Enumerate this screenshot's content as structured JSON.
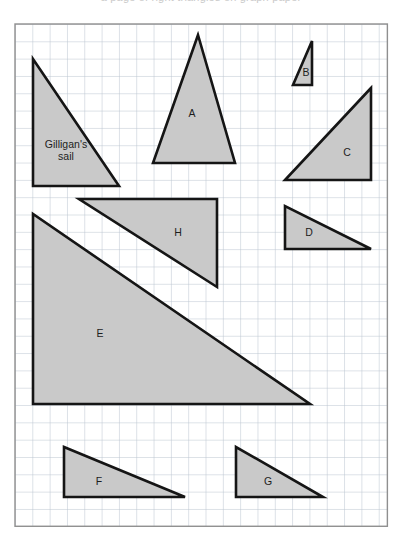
{
  "page": {
    "title_strip": "a page of right triangles on graph paper",
    "width": 402,
    "height": 549,
    "background_color": "#ffffff"
  },
  "grid": {
    "name": "graph-paper-grid",
    "origin_x": 15,
    "origin_y": 24,
    "cell_size": 17.32,
    "cols": 21.5,
    "rows": 29,
    "line_color": "#b9c4cf",
    "border_color": "#8f8f8f",
    "fill_color": "#ffffff"
  },
  "style": {
    "triangle_fill": "#c9c9c9",
    "triangle_stroke": "#151515",
    "triangle_stroke_width": 2.6,
    "label_color": "#1d1d1d"
  },
  "shapes": [
    {
      "id": "gilligans-sail",
      "label": "Gilligan's sail",
      "label_lines": [
        "Gilligan's",
        "sail"
      ],
      "label_x": 66,
      "label_y": 150,
      "points": "33,59 33,186 119,186"
    },
    {
      "id": "triangle-a",
      "label": "A",
      "label_lines": [
        "A"
      ],
      "label_x": 192,
      "label_y": 113,
      "points": "198,35 153,163 235,163"
    },
    {
      "id": "triangle-b",
      "label": "B",
      "label_lines": [
        "B"
      ],
      "label_x": 306,
      "label_y": 72,
      "points": "312,41 293,85 312,85"
    },
    {
      "id": "triangle-c",
      "label": "C",
      "label_lines": [
        "C"
      ],
      "label_x": 347,
      "label_y": 152,
      "points": "371,88 285,180 371,180"
    },
    {
      "id": "triangle-d",
      "label": "D",
      "label_lines": [
        "D"
      ],
      "label_x": 309,
      "label_y": 232,
      "points": "285,206 285,249 371,249"
    },
    {
      "id": "triangle-e",
      "label": "E",
      "label_lines": [
        "E"
      ],
      "label_x": 100,
      "label_y": 333,
      "points": "33,214 33,404 310,404"
    },
    {
      "id": "triangle-f",
      "label": "F",
      "label_lines": [
        "F"
      ],
      "label_x": 99,
      "label_y": 481,
      "points": "64,447 64,497 185,497"
    },
    {
      "id": "triangle-g",
      "label": "G",
      "label_lines": [
        "G"
      ],
      "label_x": 268,
      "label_y": 481,
      "points": "236,447 236,497 323,497"
    },
    {
      "id": "triangle-h",
      "label": "H",
      "label_lines": [
        "H"
      ],
      "label_x": 178,
      "label_y": 232,
      "points": "79,199 217,199 217,287"
    }
  ]
}
